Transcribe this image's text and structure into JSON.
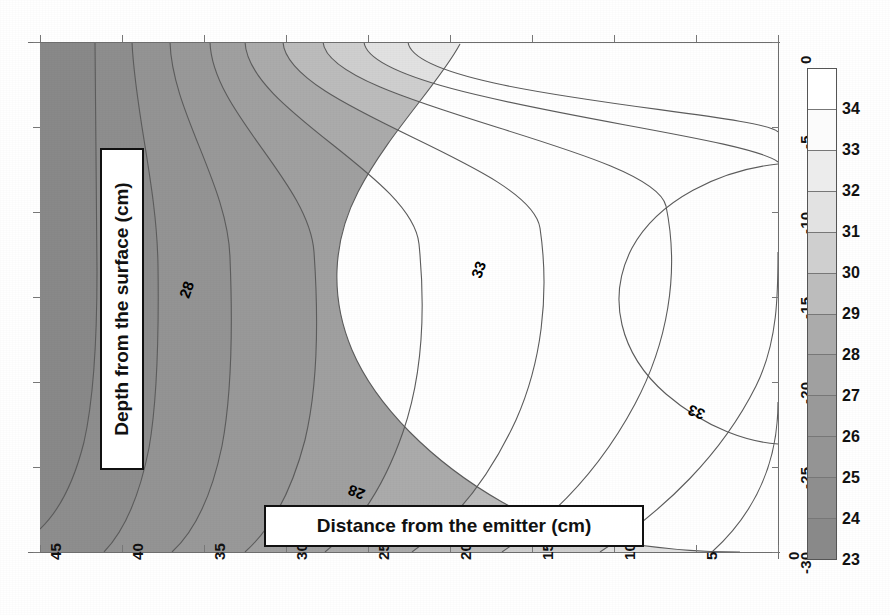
{
  "chart_data": {
    "type": "heatmap",
    "title": "",
    "subtitle": "",
    "xlabel": "Distance from the emitter (cm)",
    "ylabel": "Depth from the surface (cm)",
    "xlim": [
      45,
      0
    ],
    "ylim": [
      -30,
      0
    ],
    "x_ticks": [
      "45",
      "40",
      "35",
      "30",
      "25",
      "20",
      "15",
      "10",
      "5",
      "0"
    ],
    "y_ticks": [
      "0",
      "-5",
      "-10",
      "-15",
      "-20",
      "-25",
      "-30"
    ],
    "grid": false,
    "legend_position": "right",
    "colorbar": {
      "orientation": "vertical",
      "min": 23,
      "max": 34,
      "tick_labels": [
        "34",
        "33",
        "32",
        "31",
        "30",
        "29",
        "28",
        "27",
        "26",
        "25",
        "24",
        "23"
      ],
      "band_colors": [
        "#ffffff",
        "#fbfbfb",
        "#ececec",
        "#e2e2e2",
        "#cfcfcf",
        "#bcbcbc",
        "#ababab",
        "#a0a0a0",
        "#999999",
        "#949494",
        "#8e8e8e",
        "#898989"
      ]
    },
    "contour_labels": [
      {
        "value": "28",
        "x": 178,
        "y": 281
      },
      {
        "value": "28",
        "x": 348,
        "y": 484
      },
      {
        "value": "33",
        "x": 470,
        "y": 261
      },
      {
        "value": "33",
        "x": 688,
        "y": 404
      }
    ],
    "contour_levels": [
      23,
      24,
      25,
      26,
      27,
      28,
      29,
      30,
      31,
      32,
      33,
      34
    ],
    "hot_spot": {
      "x": 3,
      "y": -12,
      "value": 34
    }
  },
  "figure": {
    "background_color": "#ffffff",
    "axis_color": "#6d6d6d",
    "label_box_border": "#111111",
    "label_box_fill": "#ffffff"
  }
}
